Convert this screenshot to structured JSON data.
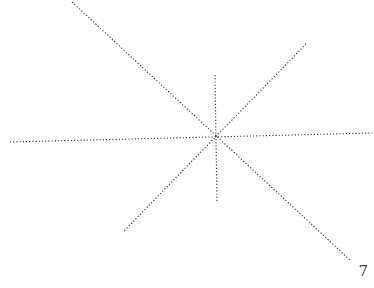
{
  "diagram": {
    "line_count": 4,
    "line_color": "#333333",
    "line_style": "dotted"
  },
  "page": {
    "number": "7"
  }
}
